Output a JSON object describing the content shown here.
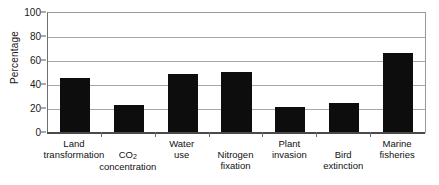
{
  "chart_data": {
    "type": "bar",
    "title": "",
    "xlabel": "",
    "ylabel": "Percentage",
    "ylim": [
      0,
      100
    ],
    "yticks": [
      0,
      20,
      40,
      60,
      80,
      100
    ],
    "grid": true,
    "legend": null,
    "categories": [
      "Land transformation",
      "CO2 concentration",
      "Water use",
      "Nitrogen fixation",
      "Plant invasion",
      "Bird extinction",
      "Marine fisheries"
    ],
    "values": [
      46,
      23,
      49,
      51,
      22,
      25,
      67
    ],
    "bar_color": "#0d0d0d"
  },
  "axis": {
    "y_title": "Percentage",
    "y_tick_labels": [
      "100",
      "80",
      "60",
      "40",
      "20",
      "0"
    ]
  },
  "categories": [
    {
      "line1": "Land",
      "line2": "transformation",
      "row": "hi"
    },
    {
      "line1": "CO",
      "sub": "2",
      "line2": "concentration",
      "row": "lo"
    },
    {
      "line1": "Water",
      "line2": "use",
      "row": "hi"
    },
    {
      "line1": "Nitrogen",
      "line2": "fixation",
      "row": "lo"
    },
    {
      "line1": "Plant",
      "line2": "invasion",
      "row": "hi"
    },
    {
      "line1": "Bird",
      "line2": "extinction",
      "row": "lo"
    },
    {
      "line1": "Marine",
      "line2": "fisheries",
      "row": "hi"
    }
  ]
}
